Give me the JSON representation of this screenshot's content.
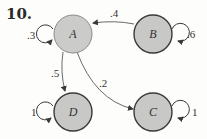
{
  "problem_number": "10.",
  "colors": {
    "node_fill": "#c8c8c6",
    "node_border_dark": "#3a3a3a",
    "node_border_light": "#8a8a88",
    "edge": "#6a6a68",
    "background": "#fdfdfb"
  },
  "nodes": [
    {
      "id": "A",
      "label": "A",
      "self_loop": ".3"
    },
    {
      "id": "B",
      "label": "B",
      "self_loop": ".6"
    },
    {
      "id": "C",
      "label": "C",
      "self_loop": "1"
    },
    {
      "id": "D",
      "label": "D",
      "self_loop": "1"
    }
  ],
  "edges": [
    {
      "from": "B",
      "to": "A",
      "label": ".4"
    },
    {
      "from": "A",
      "to": "D",
      "label": ".5"
    },
    {
      "from": "A",
      "to": "C",
      "label": ".2"
    }
  ]
}
